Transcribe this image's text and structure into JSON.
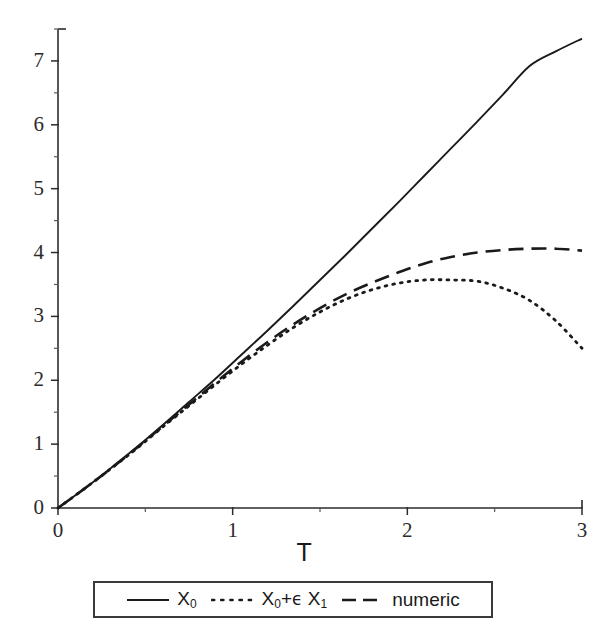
{
  "chart_data": {
    "type": "line",
    "title": "",
    "xlabel": "T",
    "ylabel": "",
    "xlim": [
      0,
      3
    ],
    "ylim": [
      0,
      7.5
    ],
    "grid": false,
    "legend_position": "below-axes",
    "x_ticks": [
      "0",
      "1",
      "2",
      "3"
    ],
    "x_tick_values": [
      0,
      1,
      2,
      3
    ],
    "x_minor_tick_values": [
      0.5,
      1.5,
      2.5
    ],
    "y_ticks": [
      "0",
      "1",
      "2",
      "3",
      "4",
      "5",
      "6",
      "7"
    ],
    "y_tick_values": [
      0,
      1,
      2,
      3,
      4,
      5,
      6,
      7
    ],
    "y_minor_tick_values": [
      0.5,
      1.5,
      2.5,
      3.5,
      4.5,
      5.5,
      6.5,
      7.5
    ],
    "x": [
      0,
      0.15,
      0.3,
      0.45,
      0.6,
      0.75,
      0.9,
      1.05,
      1.2,
      1.35,
      1.5,
      1.65,
      1.8,
      1.95,
      2.1,
      2.25,
      2.4,
      2.55,
      2.7,
      2.85,
      3
    ],
    "series": [
      {
        "name": "X_0",
        "label": "X",
        "label_sub": "0",
        "style": "solid",
        "color": "#1a1a1a",
        "values": [
          0,
          0.3,
          0.62,
          0.95,
          1.3,
          1.66,
          2.02,
          2.4,
          2.78,
          3.17,
          3.57,
          3.97,
          4.38,
          4.79,
          5.21,
          5.63,
          6.05,
          6.48,
          6.92,
          7.15,
          7.35
        ]
      },
      {
        "name": "X_0+eps X_1",
        "label_a": "X",
        "label_a_sub": "0",
        "label_plus": "+",
        "label_eps": "ϵ",
        "label_b": " X",
        "label_b_sub": "1",
        "style": "dotted",
        "color": "#1a1a1a",
        "values": [
          0,
          0.3,
          0.61,
          0.93,
          1.27,
          1.6,
          1.93,
          2.25,
          2.55,
          2.83,
          3.07,
          3.27,
          3.42,
          3.52,
          3.57,
          3.57,
          3.55,
          3.44,
          3.25,
          2.93,
          2.5
        ]
      },
      {
        "name": "numeric",
        "label": "numeric",
        "style": "dashed",
        "color": "#1a1a1a",
        "values": [
          0,
          0.3,
          0.61,
          0.94,
          1.28,
          1.62,
          1.96,
          2.29,
          2.6,
          2.88,
          3.13,
          3.35,
          3.53,
          3.69,
          3.83,
          3.93,
          4.0,
          4.04,
          4.06,
          4.06,
          4.03
        ]
      }
    ]
  },
  "axis": {
    "x_title": "T"
  },
  "legend": {
    "entries": [
      {
        "id": "x0",
        "sample": "solid-line-sample"
      },
      {
        "id": "x0-eps-x1",
        "sample": "dotted-line-sample"
      },
      {
        "id": "numeric",
        "sample": "dashed-line-sample"
      }
    ],
    "x0_text": "X",
    "x0_sub": "0",
    "eps_prefix": "X",
    "eps_prefix_sub": "0",
    "eps_plus": "+",
    "eps_symbol": "ϵ",
    "eps_suffix": " X",
    "eps_suffix_sub": "1",
    "numeric_text": "numeric"
  }
}
